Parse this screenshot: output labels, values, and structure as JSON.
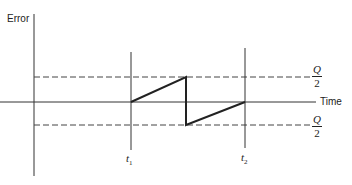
{
  "diagram": {
    "type": "quantization-error-sawtooth",
    "y_axis_label": "Error",
    "x_axis_label": "Time",
    "upper_bound_label": {
      "numerator": "Q",
      "denominator": "2"
    },
    "lower_bound_label": {
      "numerator": "Q",
      "denominator": "2"
    },
    "time_markers": [
      {
        "label": "t",
        "subscript": "1"
      },
      {
        "label": "t",
        "subscript": "2"
      }
    ],
    "colors": {
      "line": "#222222",
      "axis": "#333333",
      "dash": "#444444",
      "background": "#ffffff"
    }
  }
}
